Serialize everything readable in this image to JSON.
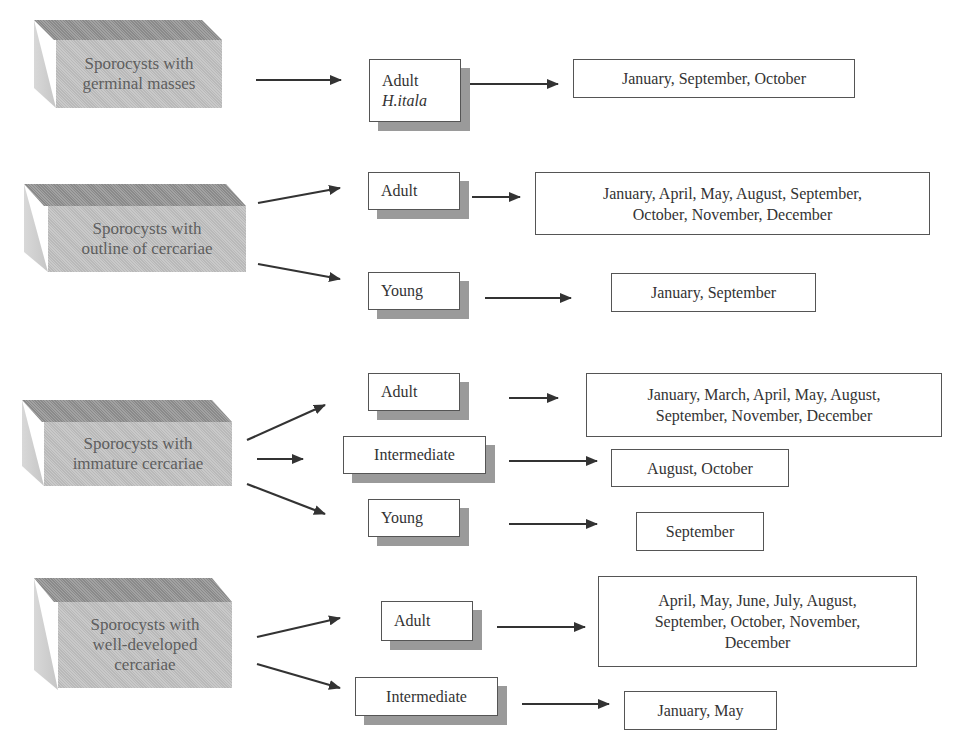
{
  "diagram": {
    "groups": [
      {
        "source": "Sporocysts with\ngerminal masses",
        "branches": [
          {
            "stage": "Adult",
            "stage_sub": "H.itala",
            "months": "January, September, October"
          }
        ]
      },
      {
        "source": "Sporocysts with\noutline of cercariae",
        "branches": [
          {
            "stage": "Adult",
            "months": "January, April, May, August, September,\nOctober, November, December"
          },
          {
            "stage": "Young",
            "months": "January, September"
          }
        ]
      },
      {
        "source": "Sporocysts with\nimmature cercariae",
        "branches": [
          {
            "stage": "Adult",
            "months": "January, March, April, May, August,\nSeptember, November, December"
          },
          {
            "stage": "Intermediate",
            "months": "August, October"
          },
          {
            "stage": "Young",
            "months": "September"
          }
        ]
      },
      {
        "source": "Sporocysts with\nwell-developed\ncercariae",
        "branches": [
          {
            "stage": "Adult",
            "months": "April,  May, June, July, August,\nSeptember, October, November,\nDecember"
          },
          {
            "stage": "Intermediate",
            "months": "January, May"
          }
        ]
      }
    ],
    "colors": {
      "arrow": "#333333",
      "shadow": "#9a9a9a",
      "cube_front": "#c2c2c2",
      "cube_top": "#959595"
    }
  }
}
